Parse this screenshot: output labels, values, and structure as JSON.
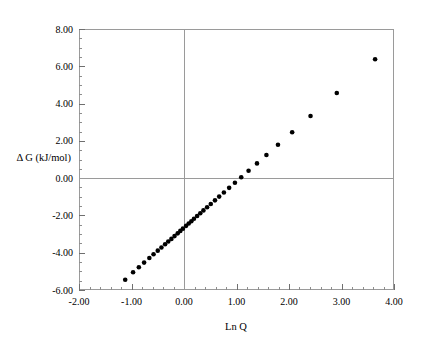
{
  "chart_data": {
    "type": "scatter",
    "title": "",
    "xlabel": "Ln Q",
    "ylabel": "Δ G (kJ/mol)",
    "xlim": [
      -2.0,
      4.0
    ],
    "ylim": [
      -6.0,
      8.0
    ],
    "x_ticks": [
      -2.0,
      -1.0,
      0.0,
      1.0,
      2.0,
      3.0,
      4.0
    ],
    "x_tick_labels": [
      "-2.00",
      "-1.00",
      "0.00",
      "1.00",
      "2.00",
      "3.00",
      "4.00"
    ],
    "y_ticks": [
      -6.0,
      -4.0,
      -2.0,
      0.0,
      2.0,
      4.0,
      6.0,
      8.0
    ],
    "y_tick_labels": [
      "-6.00",
      "-4.00",
      "-2.00",
      "0.00",
      "2.00",
      "4.00",
      "6.00",
      "8.00"
    ],
    "x_minor_tick_step": 0.2,
    "y_minor_tick_step": 0.5,
    "grid": false,
    "legend": null,
    "zero_lines": {
      "x": 0.0,
      "y": 0.0
    },
    "marker": {
      "shape": "circle",
      "color": "#000000",
      "size_px": 4.6
    },
    "series": [
      {
        "name": "Δ G vs Ln Q",
        "x": [
          -1.12,
          -0.97,
          -0.86,
          -0.76,
          -0.66,
          -0.58,
          -0.5,
          -0.43,
          -0.36,
          -0.3,
          -0.24,
          -0.18,
          -0.12,
          -0.07,
          -0.02,
          0.04,
          0.09,
          0.14,
          0.19,
          0.25,
          0.31,
          0.37,
          0.44,
          0.51,
          0.59,
          0.67,
          0.76,
          0.86,
          0.97,
          1.09,
          1.23,
          1.39,
          1.57,
          1.79,
          2.06,
          2.41,
          2.91,
          3.64
        ],
        "y": [
          -5.45,
          -5.05,
          -4.78,
          -4.53,
          -4.28,
          -4.08,
          -3.89,
          -3.72,
          -3.55,
          -3.4,
          -3.26,
          -3.11,
          -2.96,
          -2.83,
          -2.71,
          -2.56,
          -2.43,
          -2.31,
          -2.18,
          -2.03,
          -1.88,
          -1.73,
          -1.56,
          -1.39,
          -1.19,
          -0.99,
          -0.77,
          -0.52,
          -0.25,
          0.05,
          0.4,
          0.79,
          1.24,
          1.79,
          2.46,
          3.33,
          4.57,
          6.38
        ]
      }
    ],
    "axis_pixel_frame": {
      "left": 79,
      "right": 394,
      "top": 29,
      "bottom": 290
    }
  },
  "figure": {
    "background_color": "#ffffff",
    "axis_color": "#9a9a9a",
    "text_color": "#000000"
  }
}
